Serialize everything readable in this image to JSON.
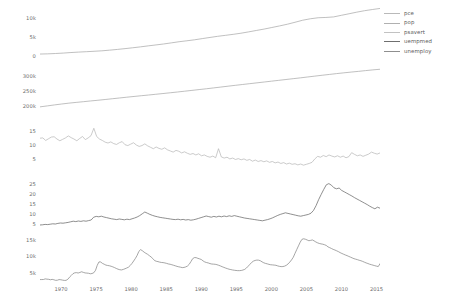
{
  "chart_data": {
    "type": "line",
    "title": "",
    "xlabel": "",
    "ylabel": "",
    "grid": false,
    "legend_position": "right",
    "layout": "faceted-stacked-5-panels-shared-x",
    "x": [
      1967,
      1970,
      1975,
      1980,
      1985,
      1990,
      1995,
      2000,
      2005,
      2010,
      2015
    ],
    "xlim": [
      1967,
      2015.5
    ],
    "xticks": [
      "1970",
      "1975",
      "1980",
      "1985",
      "1990",
      "1995",
      "2000",
      "2005",
      "2010",
      "2015"
    ],
    "xtick_values": [
      1970,
      1975,
      1980,
      1985,
      1990,
      1995,
      2000,
      2005,
      2010,
      2015
    ],
    "legend": [
      {
        "name": "pce",
        "color": "#b9b9b9"
      },
      {
        "name": "pop",
        "color": "#b0b0b0"
      },
      {
        "name": "psavert",
        "color": "#c2c2c2"
      },
      {
        "name": "uempmed",
        "color": "#6f6f6f"
      },
      {
        "name": "unemploy",
        "color": "#8f8f8f"
      }
    ],
    "panels": [
      {
        "name": "pce",
        "color": "#a5a5a5",
        "ylim": [
          0,
          12500
        ],
        "yticks": [
          "0",
          "5k",
          "10k"
        ],
        "ytick_values": [
          0,
          5000,
          10000
        ],
        "values": [
          508,
          560,
          650,
          760,
          900,
          1020,
          1120,
          1230,
          1350,
          1520,
          1710,
          1920,
          2140,
          2380,
          2640,
          2880,
          3130,
          3420,
          3720,
          3960,
          4220,
          4530,
          4830,
          5130,
          5380,
          5640,
          5930,
          6280,
          6650,
          7010,
          7420,
          7830,
          8270,
          8780,
          9320,
          9700,
          9960,
          10040,
          10180,
          10600,
          11000,
          11420,
          11800,
          12100,
          12380
        ]
      },
      {
        "name": "pop",
        "color": "#a5a5a5",
        "ylim": [
          195000,
          325000
        ],
        "yticks": [
          "200k",
          "250k",
          "300k"
        ],
        "ytick_values": [
          200000,
          250000,
          300000
        ],
        "values": [
          198712,
          201760,
          205000,
          208000,
          210800,
          213200,
          215500,
          217900,
          220200,
          222600,
          225100,
          227600,
          230100,
          232500,
          234900,
          237200,
          239600,
          242000,
          244500,
          247000,
          249600,
          252200,
          254900,
          257500,
          260300,
          263100,
          265900,
          268700,
          271400,
          274100,
          276800,
          279500,
          282200,
          284900,
          287600,
          290300,
          293000,
          295800,
          298600,
          301400,
          304100,
          306800,
          309300,
          311700,
          314000,
          316500,
          318900,
          320900
        ]
      },
      {
        "name": "psavert",
        "color": "#b4b4b4",
        "ylim": [
          2,
          17.5
        ],
        "yticks": [
          "5",
          "10",
          "15"
        ],
        "ytick_values": [
          5,
          10,
          15
        ],
        "values": [
          12.5,
          12.6,
          11.7,
          12.3,
          12.9,
          13.0,
          12.2,
          11.6,
          12.1,
          12.6,
          13.3,
          12.7,
          12.2,
          11.6,
          12.4,
          13.1,
          12.0,
          12.6,
          13.4,
          16.0,
          13.1,
          12.2,
          11.7,
          11.1,
          10.8,
          11.2,
          10.6,
          10.3,
          10.9,
          11.3,
          10.2,
          9.9,
          10.4,
          10.9,
          10.1,
          9.6,
          9.9,
          10.5,
          9.8,
          9.3,
          8.8,
          9.4,
          8.9,
          8.6,
          9.1,
          8.4,
          8.0,
          7.6,
          8.2,
          7.9,
          7.3,
          7.7,
          7.2,
          6.8,
          7.1,
          6.6,
          7.0,
          6.3,
          6.6,
          6.1,
          5.8,
          6.2,
          5.6,
          8.8,
          5.9,
          5.5,
          5.8,
          5.2,
          5.5,
          5.0,
          5.3,
          4.9,
          5.2,
          4.7,
          5.0,
          4.4,
          4.8,
          4.3,
          4.6,
          4.2,
          4.5,
          4.0,
          4.3,
          3.8,
          4.1,
          3.6,
          3.9,
          3.4,
          3.7,
          3.3,
          3.5,
          3.1,
          3.4,
          3.0,
          3.3,
          3.6,
          4.0,
          5.2,
          6.1,
          5.8,
          6.4,
          6.0,
          6.6,
          6.2,
          5.9,
          6.3,
          5.8,
          6.2,
          5.6,
          6.0,
          7.4,
          6.8,
          6.3,
          6.6,
          6.1,
          6.5,
          6.9,
          7.6,
          7.2,
          6.9,
          7.3
        ]
      },
      {
        "name": "uempmed",
        "color": "#5f5f5f",
        "ylim": [
          3,
          27
        ],
        "yticks": [
          "5",
          "10",
          "15",
          "20",
          "25"
        ],
        "ytick_values": [
          5,
          10,
          15,
          20,
          25
        ],
        "values": [
          4.5,
          4.6,
          4.8,
          4.7,
          4.9,
          5.1,
          5.0,
          5.3,
          5.5,
          5.4,
          5.6,
          5.8,
          6.1,
          6.4,
          6.2,
          6.5,
          6.3,
          6.6,
          6.4,
          6.7,
          7.0,
          8.4,
          8.8,
          8.6,
          8.9,
          8.5,
          8.2,
          7.9,
          7.6,
          7.4,
          7.2,
          7.5,
          7.3,
          7.1,
          7.4,
          7.2,
          7.6,
          8.0,
          8.5,
          9.2,
          10.1,
          11.0,
          10.4,
          9.8,
          9.3,
          8.9,
          8.6,
          8.3,
          8.1,
          7.9,
          7.7,
          7.5,
          7.3,
          7.2,
          7.4,
          7.1,
          7.3,
          7.0,
          7.2,
          6.9,
          7.1,
          7.4,
          7.8,
          8.2,
          8.6,
          9.0,
          8.7,
          8.4,
          8.8,
          8.5,
          8.9,
          8.6,
          9.0,
          8.7,
          9.1,
          8.8,
          9.2,
          8.9,
          8.6,
          8.3,
          8.0,
          7.8,
          7.6,
          7.4,
          7.2,
          7.0,
          6.8,
          6.6,
          6.9,
          7.2,
          7.6,
          8.1,
          8.7,
          9.3,
          9.8,
          10.2,
          10.6,
          10.3,
          10.0,
          9.7,
          9.4,
          9.1,
          8.9,
          9.2,
          9.5,
          9.8,
          10.4,
          11.8,
          14.2,
          17.2,
          19.8,
          22.3,
          24.6,
          25.2,
          24.4,
          23.1,
          22.6,
          23.0,
          21.8,
          21.1,
          20.4,
          19.7,
          19.0,
          18.2,
          17.5,
          16.8,
          16.1,
          15.4,
          14.7,
          13.9,
          13.2,
          12.6,
          13.4,
          12.9
        ]
      },
      {
        "name": "unemploy",
        "color": "#808080",
        "ylim": [
          2200,
          16200
        ],
        "yticks": [
          "5k",
          "10k",
          "15k"
        ],
        "ytick_values": [
          5000,
          10000,
          15000
        ],
        "values": [
          2944,
          2945,
          2958,
          3143,
          3066,
          3018,
          2878,
          3001,
          2877,
          2709,
          2740,
          2938,
          2883,
          2768,
          2686,
          2689,
          3013,
          3655,
          4174,
          4729,
          4989,
          5052,
          4929,
          5113,
          5315,
          5129,
          4960,
          4919,
          4855,
          4705,
          4786,
          5018,
          5740,
          7285,
          8318,
          8288,
          7868,
          7613,
          7343,
          7230,
          7137,
          6991,
          6800,
          6580,
          6318,
          6098,
          5938,
          5880,
          6030,
          6234,
          6458,
          6718,
          7212,
          7853,
          8589,
          9386,
          10300,
          11534,
          12052,
          11724,
          11290,
          10945,
          10637,
          10230,
          9832,
          9344,
          8746,
          8518,
          8406,
          8253,
          8148,
          8108,
          7998,
          7861,
          7697,
          7599,
          7456,
          7293,
          7123,
          6952,
          6821,
          6718,
          6580,
          6633,
          6788,
          7049,
          7572,
          8396,
          9289,
          9627,
          9613,
          9402,
          9232,
          9043,
          8628,
          8296,
          8127,
          7996,
          7800,
          7677,
          7633,
          7591,
          7464,
          7290,
          7089,
          6855,
          6655,
          6447,
          6268,
          6092,
          5976,
          5859,
          5779,
          5706,
          5654,
          5661,
          5705,
          5846,
          6041,
          6448,
          7001,
          7580,
          8148,
          8545,
          8762,
          8867,
          8846,
          8673,
          8339,
          8046,
          7860,
          7724,
          7566,
          7448,
          7403,
          7351,
          7283,
          7107,
          6969,
          6885,
          6898,
          7029,
          7285,
          7694,
          8265,
          8924,
          9725,
          10914,
          12058,
          13202,
          14316,
          15180,
          15352,
          15214,
          14993,
          14764,
          14867,
          15001,
          14724,
          14387,
          14131,
          13925,
          13800,
          13705,
          13544,
          13330,
          12900,
          12650,
          12400,
          12133,
          11936,
          11699,
          11452,
          11143,
          10893,
          10657,
          10428,
          10229,
          9985,
          9765,
          9525,
          9300,
          9145,
          8999,
          8821,
          8678,
          8462,
          8238,
          8011,
          7820,
          7625,
          7465,
          7320,
          7165,
          7030,
          6905,
          7780
        ]
      }
    ]
  }
}
